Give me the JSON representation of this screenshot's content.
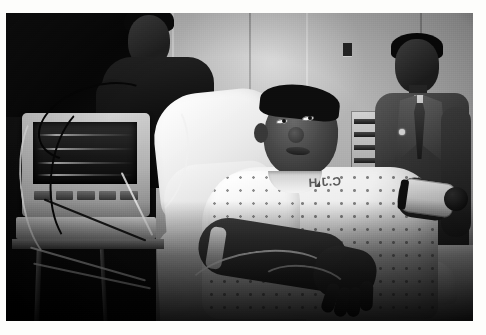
{
  "image": {
    "type": "photograph",
    "medium": "black-and-white photographic print",
    "border_color": "#ffffff",
    "scene_title": "Young man in hospital bed with vital-signs monitor",
    "setting": "hospital room",
    "orientation": "landscape"
  },
  "photo": {
    "left": 6,
    "top": 13,
    "width": 467,
    "height": 308
  },
  "subjects": {
    "patient": {
      "name": "patient-in-bed",
      "description": "Young Black man reclining on a hospital bed, head tilted back looking upward",
      "garment": "polka-dot hospital gown",
      "gown_stencil_text": "C.J.H",
      "arm_left": "resting across lap with IV tubing",
      "arm_right": "blood pressure cuff attached"
    },
    "background_person": {
      "name": "standing-person-background",
      "description": "Person in dark shirt standing behind the monitor, face partly cropped by top edge"
    },
    "man_in_suit": {
      "name": "man-in-suit",
      "description": "Man in suit jacket, dress shirt, necktie and lapel pin standing at right"
    }
  },
  "equipment": {
    "monitor": {
      "name": "vital-signs-monitor",
      "description": "Patient monitor on a rolling cart with dark waveform screen and row of buttons",
      "screen_state": "waveform traces visible",
      "button_count": 5
    },
    "cables": {
      "name": "monitor-cables",
      "description": "Coiled black and white cables draped over and around the monitor"
    },
    "iv_line": {
      "name": "iv-tubing",
      "description": "Clear IV tubing running across the patient's lap and hand"
    },
    "bp_cuff": {
      "name": "blood-pressure-cuff",
      "description": "Inflatable cuff with black bulb on patient's right arm"
    },
    "wall_panel": {
      "name": "wall-louver-panel",
      "description": "Louvred wall-mounted panel / headwall unit behind the bed"
    },
    "bed": {
      "name": "hospital-bed",
      "description": "Raised hospital bed with white pillow, sheet and folded blanket"
    }
  },
  "palette": {
    "paper_white": "#ffffff",
    "highlight": "#fbfaf7",
    "midtone": "#b2b0ab",
    "shadow": "#1a1a1a",
    "black": "#070707"
  }
}
